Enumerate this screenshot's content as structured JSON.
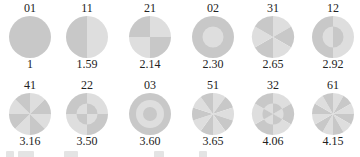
{
  "colors": {
    "dark": "#c8c8c8",
    "light": "#dedede",
    "text": "#222222"
  },
  "modes": [
    {
      "label": "01",
      "ratio": "1",
      "m": 0,
      "n": 1
    },
    {
      "label": "11",
      "ratio": "1.59",
      "m": 1,
      "n": 1
    },
    {
      "label": "21",
      "ratio": "2.14",
      "m": 2,
      "n": 1
    },
    {
      "label": "02",
      "ratio": "2.30",
      "m": 0,
      "n": 2
    },
    {
      "label": "31",
      "ratio": "2.65",
      "m": 3,
      "n": 1
    },
    {
      "label": "12",
      "ratio": "2.92",
      "m": 1,
      "n": 2
    },
    {
      "label": "41",
      "ratio": "3.16",
      "m": 4,
      "n": 1
    },
    {
      "label": "22",
      "ratio": "3.50",
      "m": 2,
      "n": 2
    },
    {
      "label": "03",
      "ratio": "3.60",
      "m": 0,
      "n": 3
    },
    {
      "label": "51",
      "ratio": "3.65",
      "m": 5,
      "n": 1
    },
    {
      "label": "32",
      "ratio": "4.06",
      "m": 3,
      "n": 2
    },
    {
      "label": "61",
      "ratio": "4.15",
      "m": 6,
      "n": 1
    }
  ]
}
